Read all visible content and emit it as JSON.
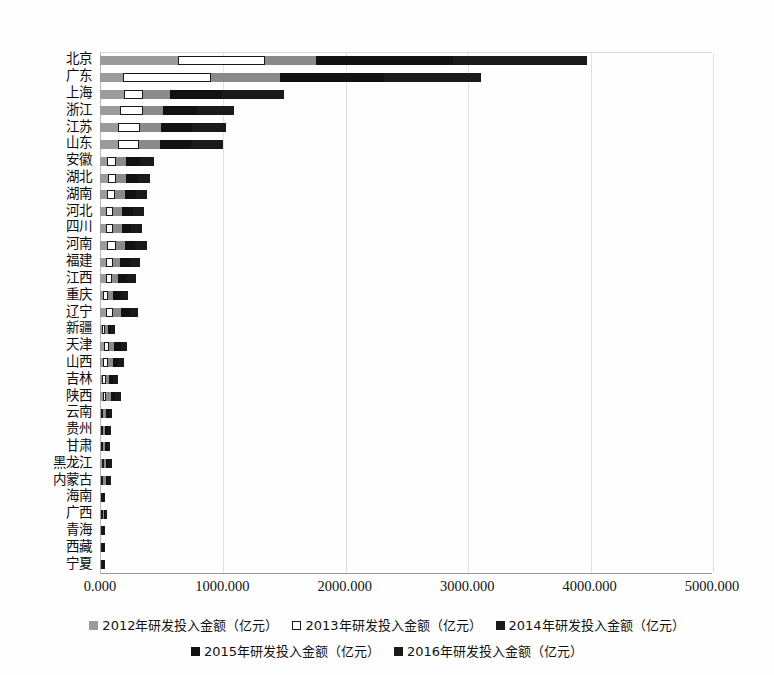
{
  "chart_data": {
    "type": "bar",
    "orientation": "horizontal",
    "stacked": true,
    "title": "",
    "subtitle": "",
    "xlabel": "",
    "ylabel": "",
    "xlim": [
      0,
      5000
    ],
    "xticks": [
      "0.000",
      "1000.000",
      "2000.000",
      "3000.000",
      "4000.000",
      "5000.000"
    ],
    "xtick_values": [
      0,
      1000,
      2000,
      3000,
      4000,
      5000
    ],
    "grid": true,
    "legend_position": "bottom",
    "categories": [
      "北京",
      "广东",
      "上海",
      "浙江",
      "江苏",
      "山东",
      "安徽",
      "湖北",
      "湖南",
      "河北",
      "四川",
      "河南",
      "福建",
      "江西",
      "重庆",
      "辽宁",
      "新疆",
      "天津",
      "山西",
      "吉林",
      "陕西",
      "云南",
      "贵州",
      "甘肃",
      "黑龙江",
      "内蒙古",
      "海南",
      "广西",
      "青海",
      "西藏",
      "宁夏"
    ],
    "series": [
      {
        "name": "2012年研发投入金额（亿元）",
        "color": "#9b9b9b",
        "marker": "gray-square",
        "values": [
          640,
          190,
          200,
          165,
          150,
          148,
          58,
          62,
          55,
          48,
          52,
          60,
          48,
          45,
          28,
          50,
          16,
          32,
          28,
          20,
          22,
          12,
          10,
          11,
          14,
          12,
          4,
          6,
          2,
          1,
          3
        ]
      },
      {
        "name": "2013年研发投入金额（亿元）",
        "color": "#ffffff",
        "marker": "white-square",
        "values": [
          705,
          720,
          150,
          190,
          175,
          170,
          75,
          72,
          70,
          62,
          58,
          68,
          55,
          50,
          38,
          58,
          22,
          40,
          36,
          26,
          30,
          16,
          14,
          14,
          18,
          16,
          5,
          8,
          3,
          1,
          4
        ]
      },
      {
        "name": "2014年研发投入金额（亿元）",
        "color": "#8a8a8a",
        "marker": "dark-gray-square",
        "values": [
          420,
          560,
          225,
          160,
          170,
          172,
          82,
          78,
          76,
          70,
          66,
          74,
          62,
          56,
          44,
          62,
          26,
          44,
          40,
          30,
          34,
          20,
          18,
          16,
          20,
          18,
          6,
          10,
          3,
          1,
          4
        ]
      },
      {
        "name": "2015年研发投入金额（亿元）",
        "color": "#111111",
        "marker": "black-square",
        "values": [
          1120,
          850,
          420,
          280,
          260,
          250,
          110,
          95,
          90,
          86,
          80,
          88,
          78,
          68,
          58,
          72,
          30,
          52,
          46,
          34,
          40,
          24,
          22,
          18,
          22,
          20,
          7,
          11,
          4,
          1,
          5
        ]
      },
      {
        "name": "2016年研发投入金额（亿元）",
        "color": "#1a1a1a",
        "marker": "black-square",
        "values": [
          1090,
          790,
          505,
          300,
          275,
          262,
          120,
          100,
          95,
          90,
          86,
          92,
          82,
          72,
          62,
          70,
          32,
          56,
          50,
          36,
          44,
          26,
          24,
          20,
          24,
          22,
          8,
          12,
          4,
          1,
          5
        ]
      }
    ],
    "totals": [
      3975,
      3110,
      1500,
      1095,
      1030,
      1002,
      445,
      407,
      386,
      356,
      342,
      382,
      325,
      291,
      230,
      312,
      126,
      224,
      200,
      146,
      170,
      98,
      88,
      79,
      98,
      88,
      30,
      47,
      16,
      5,
      21
    ]
  },
  "legend": {
    "rows": [
      [
        "2012年研发投入金额（亿元）",
        "2013年研发投入金额（亿元）",
        "2014年研发投入金额（亿元）"
      ],
      [
        "2015年研发投入金额（亿元）",
        "2016年研发投入金额（亿元）"
      ]
    ]
  }
}
